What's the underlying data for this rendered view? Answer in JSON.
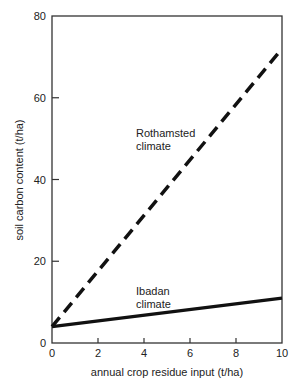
{
  "chart_data": {
    "type": "line",
    "title": "",
    "xlabel": "annual crop residue input (t/ha)",
    "ylabel": "soil carbon content (t/ha)",
    "xlim": [
      0,
      10
    ],
    "ylim": [
      0,
      80
    ],
    "xticks": [
      0,
      2,
      4,
      6,
      8,
      10
    ],
    "yticks": [
      0,
      20,
      40,
      60,
      80
    ],
    "grid": false,
    "legend": "inline labels",
    "series": [
      {
        "name": "Rothamsted climate",
        "label_line1": "Rothamsted",
        "label_line2": "climate",
        "style": "dashed",
        "x": [
          0,
          10
        ],
        "values": [
          4,
          72
        ]
      },
      {
        "name": "Ibadan climate",
        "label_line1": "Ibadan",
        "label_line2": "climate",
        "style": "solid",
        "x": [
          0,
          10
        ],
        "values": [
          4,
          11
        ]
      }
    ]
  },
  "colors": {
    "line": "#111111",
    "axis": "#333333",
    "background": "#ffffff"
  }
}
